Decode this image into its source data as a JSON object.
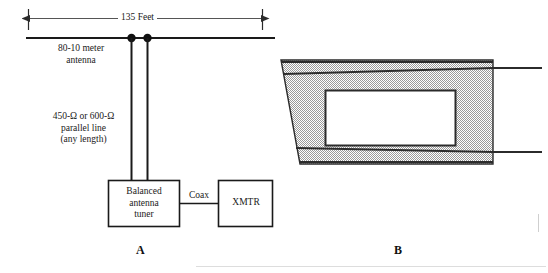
{
  "figure": {
    "panel_a": {
      "letter": "A",
      "dimension_label": "135 Feet",
      "antenna_label": "80-10 meter\nantenna",
      "feedline_label": "450-Ω or 600-Ω\nparallel line\n(any length)",
      "tuner_label": "Balanced\nantenna\ntuner",
      "coax_label": "Coax",
      "xmtr_label": "XMTR"
    },
    "panel_b": {
      "letter": "B"
    },
    "colors": {
      "ink": "#1a1a1a",
      "line": "#2b2b2b",
      "shade_fill": "#bcbcbc",
      "background": "#ffffff"
    }
  }
}
